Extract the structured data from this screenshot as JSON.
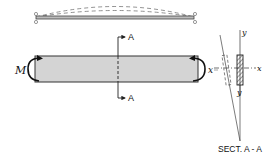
{
  "diagram": {
    "type": "beam-bending",
    "beam_top": {
      "description": "simply supported beam with dashed deflected shapes"
    },
    "main_bar": {
      "fill_color": "#d4d4d4",
      "stroke_color": "#333333",
      "moment_label": "M",
      "right_label": "x"
    },
    "section_cut": {
      "top_label": "A",
      "bottom_label": "A"
    },
    "cross_section": {
      "y_top_label": "y",
      "y_bottom_label": "y",
      "x_left_label": "x",
      "x_right_label": "x",
      "caption": "SECT. A - A"
    }
  }
}
